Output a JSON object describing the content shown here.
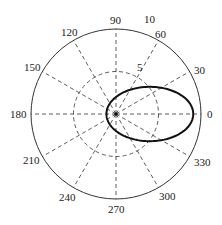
{
  "chart_data": {
    "type": "line",
    "subtype": "polar",
    "title": "",
    "xlabel": "",
    "ylabel": "",
    "theta_unit": "degrees",
    "theta_ticks": [
      0,
      30,
      60,
      90,
      120,
      150,
      180,
      210,
      240,
      270,
      300,
      330
    ],
    "theta_tick_labels": [
      "0",
      "30",
      "60",
      "90",
      "120",
      "150",
      "180",
      "210",
      "240",
      "270",
      "300",
      "330"
    ],
    "r_ticks": [
      5,
      10
    ],
    "r_tick_labels": [
      "5",
      "10"
    ],
    "rlim": [
      0,
      10
    ],
    "grid": true,
    "legend": null,
    "series": [
      {
        "name": "curve",
        "description": "closed elongated loop (conic, focus at origin) pointing toward 0 degrees",
        "equation_estimate": "r = 2 / (1 - 0.78*cos(theta))",
        "theta": [
          0,
          30,
          60,
          90,
          120,
          150,
          180,
          210,
          240,
          270,
          300,
          330,
          360
        ],
        "r": [
          9.1,
          6.1,
          3.3,
          2.0,
          1.44,
          1.19,
          1.12,
          1.19,
          1.44,
          2.0,
          3.3,
          6.1,
          9.1
        ],
        "color": "#111111"
      }
    ]
  },
  "labels": {
    "t0": "0",
    "t30": "30",
    "t60": "60",
    "t90": "90",
    "t120": "120",
    "t150": "150",
    "t180": "180",
    "t210": "210",
    "t240": "240",
    "t270": "270",
    "t300": "300",
    "t330": "330",
    "r5": "5",
    "r10": "10"
  }
}
